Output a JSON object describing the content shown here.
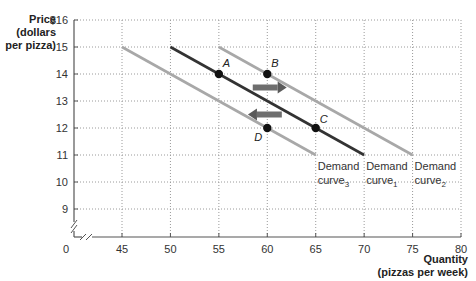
{
  "chart_data": {
    "type": "line",
    "title": "",
    "ylabel": [
      "Price",
      "(dollars",
      "per pizza)"
    ],
    "xlabel": [
      "Quantity",
      "(pizzas per week)"
    ],
    "xlim": [
      45,
      80
    ],
    "ylim": [
      9,
      16
    ],
    "axis_break": true,
    "grid": true,
    "x_ticks": [
      "0",
      "45",
      "50",
      "55",
      "60",
      "65",
      "70",
      "75",
      "80"
    ],
    "y_ticks": [
      "$16",
      "15",
      "14",
      "13",
      "12",
      "11",
      "10",
      "9"
    ],
    "series": [
      {
        "name": "Demand curve3",
        "label_main": "Demand",
        "label_sub": "curve",
        "label_subscript": "3",
        "color": "#a8a8a8",
        "points": [
          [
            45,
            15
          ],
          [
            65,
            11
          ]
        ]
      },
      {
        "name": "Demand curve1",
        "label_main": "Demand",
        "label_sub": "curve",
        "label_subscript": "1",
        "color": "#333333",
        "points": [
          [
            50,
            15
          ],
          [
            70,
            11
          ]
        ]
      },
      {
        "name": "Demand curve2",
        "label_main": "Demand",
        "label_sub": "curve",
        "label_subscript": "2",
        "color": "#a8a8a8",
        "points": [
          [
            55,
            15
          ],
          [
            75,
            11
          ]
        ]
      }
    ],
    "points": [
      {
        "label": "A",
        "x": 55,
        "y": 14
      },
      {
        "label": "B",
        "x": 60,
        "y": 14
      },
      {
        "label": "C",
        "x": 65,
        "y": 12
      },
      {
        "label": "D",
        "x": 60,
        "y": 12
      }
    ],
    "arrows": [
      {
        "direction": "right",
        "y": 13.5,
        "from": 58.5,
        "to": 62
      },
      {
        "direction": "left",
        "y": 12.5,
        "from": 61.5,
        "to": 58
      }
    ]
  },
  "labels": {
    "price": "Price",
    "price_unit1": "(dollars",
    "price_unit2": "per pizza)",
    "quantity": "Quantity",
    "quantity_unit": "(pizzas per week)"
  }
}
